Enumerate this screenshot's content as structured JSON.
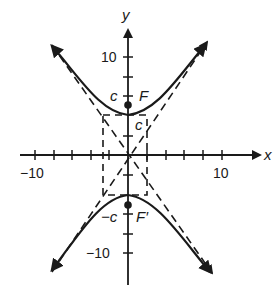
{
  "figure": {
    "type": "hyperbola-graph",
    "colors": {
      "ink": "#1a1a1a",
      "background": "#ffffff"
    }
  },
  "axes": {
    "x_label": "x",
    "y_label": "y",
    "x_tick_labels": {
      "neg": "−10",
      "pos": "10"
    },
    "y_tick_labels": {
      "pos": "10",
      "neg": "−10"
    },
    "x_range": [
      -10,
      10
    ],
    "y_range": [
      -10,
      10
    ],
    "tick_step": 2
  },
  "labels": {
    "c_upper": "c",
    "c_lower": "−c",
    "c_box": "c",
    "focus_upper": "F",
    "focus_lower": "F′"
  },
  "points": {
    "focus_upper": {
      "x": 0,
      "y": 5.4
    },
    "focus_lower": {
      "x": 0,
      "y": -5.4
    },
    "vertex_upper": {
      "x": 0,
      "y": 4.3
    },
    "vertex_lower": {
      "x": 0,
      "y": -4.3
    }
  },
  "central_box": {
    "x_min": -2.8,
    "x_max": 2.0,
    "y_min": -4.3,
    "y_max": 4.3
  }
}
